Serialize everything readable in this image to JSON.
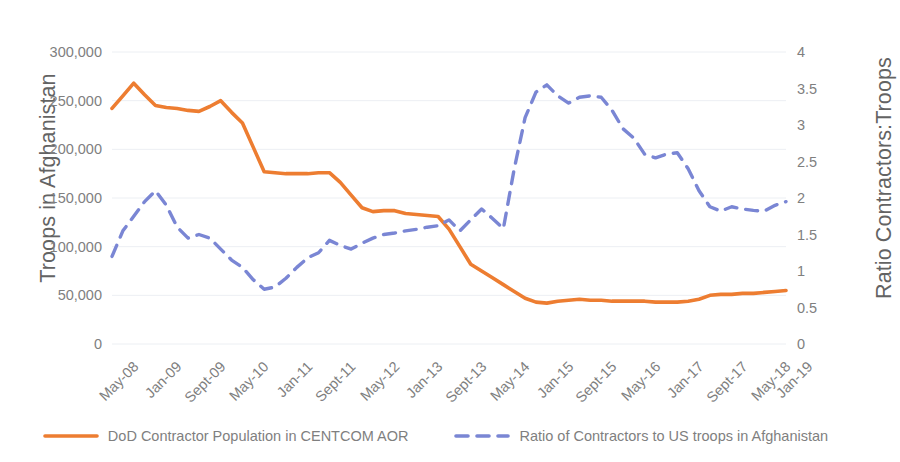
{
  "chart_data": {
    "type": "line",
    "title": "",
    "subtitle": "",
    "xlabel": "",
    "grid": true,
    "legend_position": "bottom",
    "x": [
      "May-08",
      "Aug-08",
      "Nov-08",
      "Feb-09",
      "Jan-09",
      "Apr-09",
      "Jul-09",
      "Oct-09",
      "Sept-09",
      "Dec-09",
      "Mar-10",
      "Jun-10",
      "May-10",
      "Aug-10",
      "Nov-10",
      "Feb-11",
      "Jan-11",
      "Apr-11",
      "Jul-11",
      "Oct-11",
      "Sept-11",
      "Dec-11",
      "Mar-12",
      "Jun-12",
      "May-12",
      "Aug-12",
      "Nov-12",
      "Feb-13",
      "Jan-13",
      "Apr-13",
      "Jul-13",
      "Oct-13",
      "Sept-13",
      "Dec-13",
      "Mar-14",
      "Jun-14",
      "May-14",
      "Aug-14",
      "Nov-14",
      "Feb-15",
      "Jan-15",
      "Apr-15",
      "Jul-15",
      "Oct-15",
      "Sept-15",
      "Dec-15",
      "Mar-16",
      "Jun-16",
      "May-16",
      "Aug-16",
      "Nov-16",
      "Feb-17",
      "Jan-17",
      "Apr-17",
      "Jul-17",
      "Oct-17",
      "Sept-17",
      "Dec-17",
      "Mar-18",
      "Jun-18",
      "May-18",
      "Oct-18",
      "Jan-19"
    ],
    "tick_labels": [
      "May-08",
      "Jan-09",
      "Sept-09",
      "May-10",
      "Jan-11",
      "Sept-11",
      "May-12",
      "Jan-13",
      "Sept-13",
      "May-14",
      "Jan-15",
      "Sept-15",
      "May-16",
      "Jan-17",
      "Sept-17",
      "May-18",
      "Jan-19"
    ],
    "tick_every": 4,
    "n_points": 64,
    "left_axis": {
      "label": "Troops in Afghanistan",
      "ticks": [
        "0",
        "50,000",
        "100,000",
        "150,000",
        "200,000",
        "250,000",
        "300,000"
      ],
      "min": 0,
      "max": 300000,
      "step": 50000
    },
    "right_axis": {
      "label": "Ratio Contractors:Troops",
      "ticks": [
        "0",
        "0.5",
        "1",
        "1.5",
        "2",
        "2.5",
        "3",
        "3.5",
        "4"
      ],
      "min": 0,
      "max": 4,
      "step": 0.5
    },
    "series": [
      {
        "name": "DoD Contractor Population in CENTCOM AOR",
        "color": "#ED7D31",
        "style": "solid",
        "axis": "left",
        "values": [
          242000,
          255000,
          268000,
          256000,
          245000,
          243000,
          242000,
          240000,
          239000,
          244000,
          250000,
          238000,
          227000,
          202000,
          177000,
          176000,
          175000,
          175000,
          175000,
          176000,
          176000,
          166000,
          153000,
          140000,
          136000,
          137000,
          137000,
          134000,
          133000,
          132000,
          131000,
          118000,
          100000,
          82000,
          75000,
          68000,
          61000,
          54000,
          47000,
          43000,
          42000,
          44000,
          45000,
          46000,
          45000,
          45000,
          44000,
          44000,
          44000,
          44000,
          43000,
          43000,
          43000,
          44000,
          46000,
          50000,
          51000,
          51000,
          52000,
          52000,
          53000,
          54000,
          55000
        ]
      },
      {
        "name": "Ratio of Contractors to US troops in Afghanistan",
        "color": "#7A86D4",
        "style": "dashed",
        "axis": "right",
        "values": [
          1.2,
          1.55,
          1.75,
          1.95,
          2.1,
          1.9,
          1.6,
          1.45,
          1.5,
          1.45,
          1.3,
          1.15,
          1.05,
          0.88,
          0.75,
          0.78,
          0.9,
          1.05,
          1.18,
          1.25,
          1.42,
          1.35,
          1.3,
          1.38,
          1.45,
          1.5,
          1.52,
          1.55,
          1.57,
          1.6,
          1.62,
          1.7,
          1.55,
          1.7,
          1.85,
          1.72,
          1.58,
          2.4,
          3.1,
          3.45,
          3.55,
          3.4,
          3.3,
          3.38,
          3.4,
          3.38,
          3.2,
          2.95,
          2.82,
          2.6,
          2.55,
          2.6,
          2.62,
          2.4,
          2.1,
          1.88,
          1.82,
          1.88,
          1.85,
          1.83,
          1.82,
          1.9,
          1.95
        ]
      }
    ]
  },
  "legend": {
    "items": [
      {
        "label": "DoD Contractor Population in CENTCOM AOR",
        "color": "#ED7D31",
        "style": "solid"
      },
      {
        "label": "Ratio of Contractors to US troops in Afghanistan",
        "color": "#7A86D4",
        "style": "dashed"
      }
    ]
  }
}
